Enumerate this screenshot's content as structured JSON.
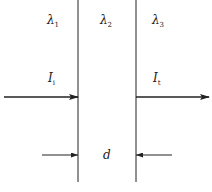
{
  "diagram": {
    "regions": [
      {
        "label": "λ",
        "subscript": "1"
      },
      {
        "label": "λ",
        "subscript": "2"
      },
      {
        "label": "λ",
        "subscript": "3"
      }
    ],
    "incident": {
      "label": "I",
      "subscript": "i"
    },
    "transmitted": {
      "label": "I",
      "subscript": "t"
    },
    "thickness": {
      "label": "d"
    },
    "colors": {
      "line": "#222222",
      "background": "#ffffff"
    }
  }
}
